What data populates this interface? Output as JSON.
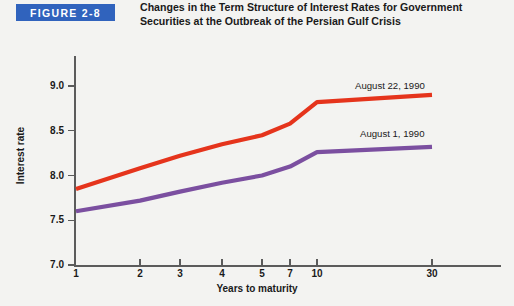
{
  "figure": {
    "badge_label": "FIGURE 2-8",
    "badge_color": "#3063bd",
    "caption": "Changes in the Term Structure of Interest Rates for Government Securities at the Outbreak of the Persian Gulf Crisis"
  },
  "chart_data": {
    "type": "line",
    "title": "Changes in the Term Structure of Interest Rates for Government Securities at the Outbreak of the Persian Gulf Crisis",
    "xlabel": "Years to maturity",
    "ylabel": "Interest rate",
    "categories": [
      "1",
      "2",
      "3",
      "4",
      "5",
      "7",
      "10",
      "30"
    ],
    "x_positions_px": [
      76,
      140,
      180,
      222,
      262,
      290,
      317,
      432
    ],
    "ylim": [
      7.0,
      9.0
    ],
    "yticks": [
      "7.0",
      "7.5",
      "8.0",
      "8.5",
      "9.0"
    ],
    "ytick_values": [
      7.0,
      7.5,
      8.0,
      8.5,
      9.0
    ],
    "grid": false,
    "legend_position": "inline-right",
    "series": [
      {
        "name": "August 22, 1990",
        "color": "#e5341c",
        "values": [
          7.85,
          8.08,
          8.22,
          8.35,
          8.45,
          8.58,
          8.82,
          8.9
        ]
      },
      {
        "name": "August 1, 1990",
        "color": "#7b4fa0",
        "values": [
          7.6,
          7.72,
          7.82,
          7.92,
          8.0,
          8.1,
          8.26,
          8.32
        ]
      }
    ],
    "annotations": [
      {
        "text": "August 22, 1990",
        "series": "August 22, 1990"
      },
      {
        "text": "August 1, 1990",
        "series": "August 1, 1990"
      }
    ]
  }
}
